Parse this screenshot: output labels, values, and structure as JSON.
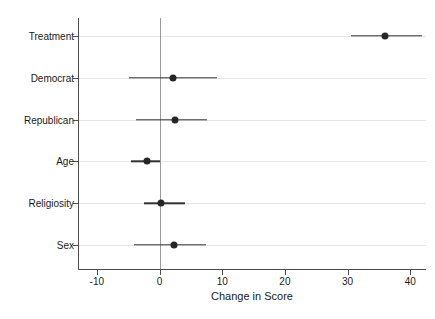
{
  "chart_data": {
    "type": "scatter",
    "title": "",
    "xlabel": "Change in Score",
    "ylabel": "",
    "xlim": [
      -13,
      42.5
    ],
    "ylim": [
      0,
      7
    ],
    "grid": true,
    "legend": "none",
    "orientation": "horizontal",
    "plot_style": "coefficient-plot",
    "reference_line": 0,
    "xticks": [
      -10,
      0,
      10,
      20,
      30,
      40
    ],
    "xtick_labels": [
      "-10",
      "0",
      "10",
      "20",
      "30",
      "40"
    ],
    "categories": [
      "Treatment",
      "Democrat",
      "Republican",
      "Age",
      "Religiosity",
      "Sex"
    ],
    "values": [
      36.0,
      2.2,
      2.5,
      -2.0,
      0.3,
      2.3
    ],
    "ci_low": [
      30.5,
      -4.8,
      -3.8,
      -4.5,
      -2.5,
      -4.0
    ],
    "ci_high": [
      41.8,
      9.1,
      7.5,
      0.0,
      4.0,
      7.4
    ],
    "points": [
      {
        "label": "Treatment",
        "estimate": 36.0,
        "ci_low": 30.5,
        "ci_high": 41.8
      },
      {
        "label": "Democrat",
        "estimate": 2.2,
        "ci_low": -4.8,
        "ci_high": 9.1
      },
      {
        "label": "Republican",
        "estimate": 2.5,
        "ci_low": -3.8,
        "ci_high": 7.5
      },
      {
        "label": "Age",
        "estimate": -2.0,
        "ci_low": -4.5,
        "ci_high": 0.0
      },
      {
        "label": "Religiosity",
        "estimate": 0.3,
        "ci_low": -2.5,
        "ci_high": 4.0
      },
      {
        "label": "Sex",
        "estimate": 2.3,
        "ci_low": -4.0,
        "ci_high": 7.4
      }
    ],
    "colors": {
      "point": "#262626",
      "interval": "#333333",
      "axis": "#4d4d4d",
      "grid": "#e6e6e6",
      "zero_line": "#999999",
      "background": "#ffffff"
    }
  }
}
